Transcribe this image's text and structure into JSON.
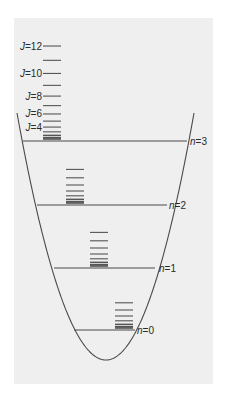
{
  "diagram": {
    "type": "vibrational-rotational energy levels in parabolic potential well",
    "background_color": "#efefef",
    "line_color": "#4a4a4a",
    "potential_curve": {
      "vertex": [
        106,
        360
      ],
      "left_top": [
        17,
        113
      ],
      "right_top": [
        194,
        113
      ]
    },
    "vibrational_levels": [
      {
        "n": 3,
        "label": "n=3",
        "y": 141,
        "x1": 23,
        "x2": 187,
        "label_x": 190
      },
      {
        "n": 2,
        "label": "n=2",
        "y": 205,
        "x1": 37,
        "x2": 167,
        "label_x": 169
      },
      {
        "n": 1,
        "label": "n=1",
        "y": 268,
        "x1": 54,
        "x2": 155,
        "label_x": 159
      },
      {
        "n": 0,
        "label": "n=0",
        "y": 330,
        "x1": 74,
        "x2": 135,
        "label_x": 137
      }
    ],
    "rotational_ladders": [
      {
        "n": 3,
        "x1": 43,
        "x2": 61,
        "base_y": 139,
        "max_J": 12,
        "scale": 0.596
      },
      {
        "n": 2,
        "x1": 66,
        "x2": 84,
        "base_y": 203,
        "max_J": 7,
        "scale": 0.6
      },
      {
        "n": 1,
        "x1": 90,
        "x2": 108,
        "base_y": 266,
        "max_J": 7,
        "scale": 0.6
      },
      {
        "n": 0,
        "x1": 115,
        "x2": 133,
        "base_y": 328,
        "max_J": 6,
        "scale": 0.6
      }
    ],
    "J_labels": [
      {
        "text": "J=12",
        "J": 12
      },
      {
        "text": "J=10",
        "J": 10
      },
      {
        "text": "J=8",
        "J": 8
      },
      {
        "text": "J=6",
        "J": 6
      },
      {
        "text": "J=4",
        "J": 4
      }
    ]
  }
}
